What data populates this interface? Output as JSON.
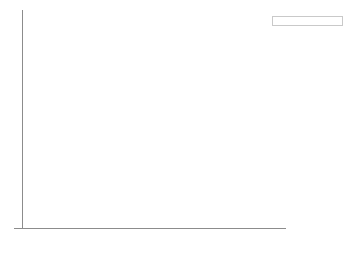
{
  "chart_data": {
    "type": "bar",
    "stacked": true,
    "title": "",
    "subtitle": "",
    "xlabel": "",
    "ylabel": "",
    "categories": [
      "2013",
      "2014",
      "2015",
      "2016"
    ],
    "series": [
      {
        "name": "Kenya",
        "color": "#111111",
        "values": [
          59,
          35,
          11,
          0
        ]
      },
      {
        "name": "Zimbabwe",
        "color": "#585858",
        "values": [
          16,
          12,
          50,
          0
        ]
      },
      {
        "name": "Namibia",
        "color": "#9b9b9b",
        "values": [
          2,
          24,
          80,
          60
        ]
      },
      {
        "name": "South Africa",
        "color": "#ebebeb",
        "values": [
          1004,
          1215,
          1175,
          1054
        ]
      }
    ],
    "value_labels": {
      "2013": [
        "59",
        "16",
        "2",
        "1,004"
      ],
      "2014": [
        "35",
        "12",
        "24",
        "1,215"
      ],
      "2015": [
        "11",
        "50",
        "80",
        "1,175"
      ],
      "2016": [
        "",
        "",
        "60",
        "1,054"
      ]
    },
    "axis": {
      "y_tick_labels": [],
      "y_tick_count": 10,
      "x_tick_labels": [
        "2013",
        "2014",
        "2015",
        "2016"
      ],
      "grid": true,
      "grid_color": "#ededed",
      "axis_color": "#8c8c8c"
    },
    "legend": {
      "position": "top-right",
      "border_color": "#c9c9c9",
      "entries": [
        {
          "label": "Kenya",
          "color": "#111111"
        },
        {
          "label": "Zimbabwe",
          "color": "#585858"
        },
        {
          "label": "Namibia",
          "color": "#9b9b9b"
        },
        {
          "label": "South Africa",
          "color": "#ebebeb"
        }
      ]
    },
    "render": {
      "bars": [
        {
          "category": "2013",
          "segments": [
            {
              "series": "Kenya",
              "label": "59",
              "height_px": 58,
              "label_style": "light"
            },
            {
              "series": "Zimbabwe",
              "label": "16",
              "height_px": 16,
              "label_style": "light"
            },
            {
              "series": "Namibia",
              "label": "2",
              "height_px": 7,
              "label_style": "dark"
            },
            {
              "series": "South Africa",
              "label": "1,004",
              "height_px": 137,
              "label_style": "dark"
            }
          ]
        },
        {
          "category": "2014",
          "segments": [
            {
              "series": "Kenya",
              "label": "35",
              "height_px": 41,
              "label_style": "light"
            },
            {
              "series": "Zimbabwe",
              "label": "12",
              "height_px": 16,
              "label_style": "light"
            },
            {
              "series": "Namibia",
              "label": "24",
              "height_px": 21,
              "label_style": "dark"
            },
            {
              "series": "South Africa",
              "label": "1,215",
              "height_px": 140,
              "label_style": "dark"
            }
          ]
        },
        {
          "category": "2015",
          "segments": [
            {
              "series": "Kenya",
              "label": "11",
              "height_px": 13,
              "label_style": "light"
            },
            {
              "series": "Zimbabwe",
              "label": "50",
              "height_px": 47,
              "label_style": "light"
            },
            {
              "series": "Namibia",
              "label": "80",
              "height_px": 63,
              "label_style": "dark"
            },
            {
              "series": "South Africa",
              "label": "1,175",
              "height_px": 86,
              "label_style": "dark"
            }
          ]
        },
        {
          "category": "2016",
          "segments": [
            {
              "series": "Namibia",
              "label": "60",
              "height_px": 56,
              "label_style": "dark"
            },
            {
              "series": "South Africa",
              "label": "1,054",
              "height_px": 156,
              "label_style": "dark"
            }
          ]
        }
      ]
    }
  }
}
